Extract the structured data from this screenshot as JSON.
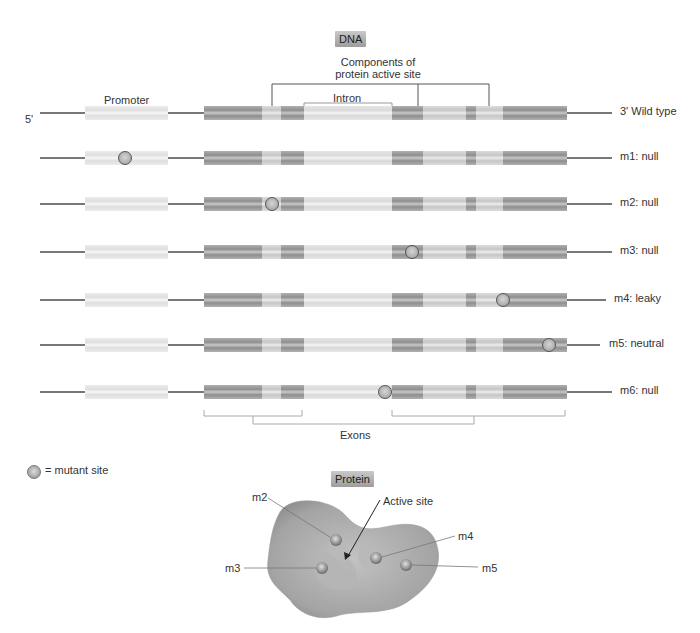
{
  "dna_section": {
    "title": "DNA",
    "active_site_label_line1": "Components of",
    "active_site_label_line2": "protein active site",
    "promoter_label": "Promoter",
    "intron_label": "Intron",
    "exons_label": "Exons",
    "five_prime_label": "5'",
    "rows": [
      {
        "label": "3' Wild type",
        "mutation": null
      },
      {
        "label": "m1: null",
        "mutation": "promoter"
      },
      {
        "label": "m2: null",
        "mutation": "exon1-active-site"
      },
      {
        "label": "m3: null",
        "mutation": "exon2"
      },
      {
        "label": "m4: leaky",
        "mutation": "exon2-active-site"
      },
      {
        "label": "m5: neutral",
        "mutation": "exon2-end"
      },
      {
        "label": "m6: null",
        "mutation": "intron-exon-junction"
      }
    ]
  },
  "legend": {
    "symbol": "mutant-site-circle",
    "text": "= mutant site"
  },
  "protein_section": {
    "title": "Protein",
    "active_site_label": "Active site",
    "mutation_labels": [
      "m2",
      "m3",
      "m4",
      "m5"
    ]
  },
  "colors": {
    "exon_dark": "#8e8e8e",
    "exon_light": "#c6c6c6",
    "protein_body": "#a9a9a9",
    "line": "#777777"
  }
}
